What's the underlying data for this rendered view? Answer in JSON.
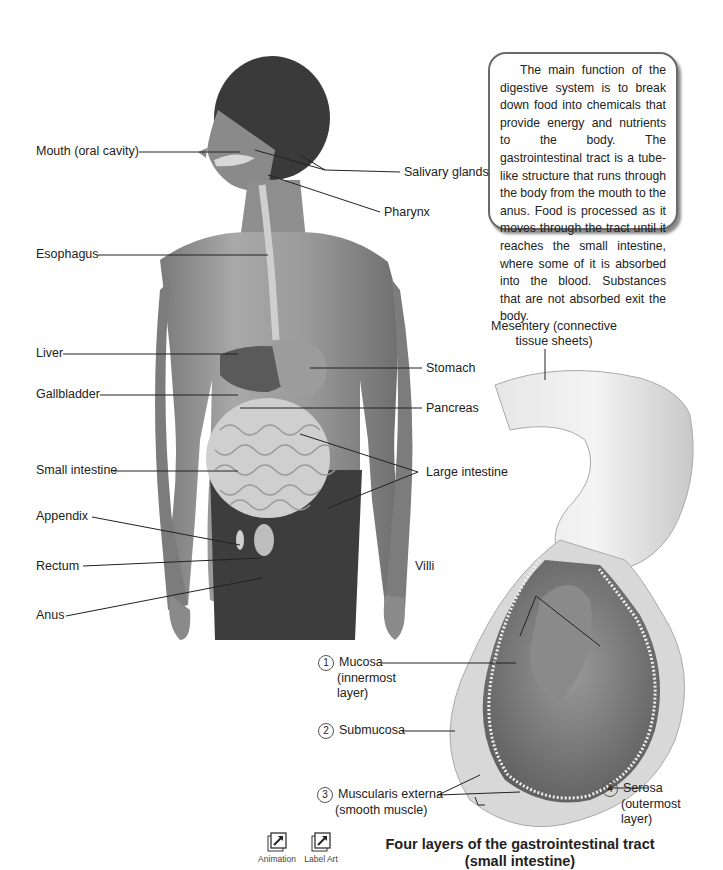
{
  "info_box": {
    "text": "The main function of the digestive system is to break down food into chemicals that provide energy and nutrients to the body. The gastrointestinal tract is a tube-like structure that runs through the body from the mouth to the anus. Food is processed as it moves through the tract until it reaches the small intestine, where some of it is absorbed into the blood. Substances that are not absorbed exit the body."
  },
  "body_labels": {
    "mouth": "Mouth (oral cavity)",
    "esophagus": "Esophagus",
    "liver": "Liver",
    "gallbladder": "Gallbladder",
    "small_intestine": "Small intestine",
    "appendix": "Appendix",
    "rectum": "Rectum",
    "anus": "Anus",
    "salivary_glands": "Salivary glands",
    "pharynx": "Pharynx",
    "stomach": "Stomach",
    "pancreas": "Pancreas",
    "large_intestine": "Large intestine"
  },
  "intestine_labels": {
    "mesentery": "Mesentery (connective tissue sheets)",
    "villi": "Villi",
    "layers": [
      {
        "num": "1",
        "name": "Mucosa",
        "detail": "(innermost layer)"
      },
      {
        "num": "2",
        "name": "Submucosa",
        "detail": ""
      },
      {
        "num": "3",
        "name": "Muscularis externa",
        "detail": "(smooth muscle)"
      },
      {
        "num": "4",
        "name": "Serosa",
        "detail": "(outermost layer)"
      }
    ]
  },
  "buttons": {
    "animation": "Animation",
    "label_art": "Label Art"
  },
  "caption": {
    "line1": "Four layers of the gastrointestinal tract",
    "line2": "(small intestine)"
  }
}
